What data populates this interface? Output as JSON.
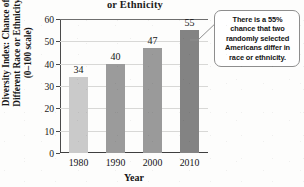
{
  "chart_data": {
    "type": "bar",
    "title": "or Ethnicity",
    "title_note": "title is clipped at top edge of screenshot",
    "xlabel": "Year",
    "ylabel_lines": [
      "Diversity Index: Chance of",
      "Different Race or Ethnicity",
      "(0–100 scale)"
    ],
    "categories": [
      "1980",
      "1990",
      "2000",
      "2010"
    ],
    "values": [
      34,
      40,
      47,
      55
    ],
    "value_labels": [
      "34",
      "40",
      "47",
      "55"
    ],
    "bar_colors": [
      "#cacaca",
      "#9b9b9b",
      "#9a9a9a",
      "#838383"
    ],
    "ylim": [
      0,
      60
    ],
    "yticks": [
      0,
      10,
      20,
      30,
      40,
      50,
      60
    ],
    "ytick_labels": [
      "0",
      "10",
      "20",
      "30",
      "40",
      "50",
      "60"
    ],
    "grid": true,
    "legend": null,
    "annotation": "There is a 55% chance that two randomly selected Americans differ in race or ethnicity."
  },
  "callout": {
    "lines": [
      "There is a 55%",
      "chance that two",
      "randomly selected",
      "Americans differ in",
      "race or ethnicity."
    ]
  }
}
